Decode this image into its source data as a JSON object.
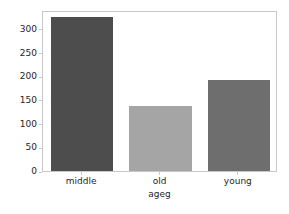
{
  "chart_data": {
    "type": "bar",
    "title": "",
    "xlabel": "ageg",
    "ylabel": "mean_income",
    "categories": [
      "middle",
      "old",
      "young"
    ],
    "values": [
      325,
      138,
      193
    ],
    "ylim": [
      0,
      340
    ],
    "yticks": [
      0,
      50,
      100,
      150,
      200,
      250,
      300
    ],
    "ytick_labels": [
      "0",
      "50",
      "100",
      "150",
      "200",
      "250",
      "300"
    ],
    "xtick_labels": [
      "middle",
      "old",
      "young"
    ],
    "grid": false,
    "legend": false,
    "bar_colors": [
      "#4d4d4d",
      "#a5a5a5",
      "#6e6e6e"
    ],
    "bar_width_fraction": 0.8,
    "background_color": "#ffffff",
    "axes_edge_color": "#c8c8c8",
    "text_color": "#262626"
  }
}
